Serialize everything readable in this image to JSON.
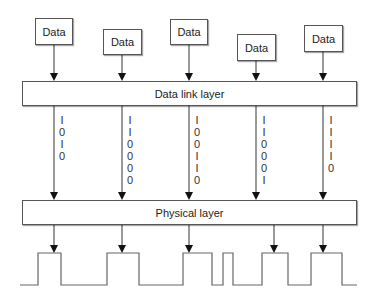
{
  "diagram": {
    "data_boxes": [
      {
        "label": "Data",
        "x": 35,
        "y": 18,
        "w": 38,
        "h": 27,
        "arrow_x": 54
      },
      {
        "label": "Data",
        "x": 103,
        "y": 29,
        "w": 39,
        "h": 26,
        "arrow_x": 122
      },
      {
        "label": "Data",
        "x": 170,
        "y": 19,
        "w": 38,
        "h": 26,
        "arrow_x": 189
      },
      {
        "label": "Data",
        "x": 237,
        "y": 34,
        "w": 39,
        "h": 27,
        "arrow_x": 256
      },
      {
        "label": "Data",
        "x": 304,
        "y": 25,
        "w": 39,
        "h": 27,
        "arrow_x": 323
      }
    ],
    "data_link_layer": {
      "label": "Data link layer",
      "x": 22,
      "y": 81,
      "w": 335,
      "h": 25
    },
    "physical_layer": {
      "label": "Physical layer",
      "x": 22,
      "y": 200,
      "w": 335,
      "h": 25
    },
    "bit_columns": [
      {
        "x": 62,
        "bits": [
          "1",
          "0",
          "1",
          "0"
        ]
      },
      {
        "x": 130,
        "bits": [
          "1",
          "1",
          "0",
          "0",
          "0",
          "0"
        ]
      },
      {
        "x": 197,
        "bits": [
          "1",
          "0",
          "0",
          "1",
          "1",
          "0"
        ]
      },
      {
        "x": 264,
        "bits": [
          "1",
          "1",
          "0",
          "0",
          "0",
          "1"
        ]
      },
      {
        "x": 331,
        "bits": [
          "1",
          "1",
          "1",
          "1",
          "0"
        ]
      }
    ],
    "bottom_arrows_x": [
      54,
      122,
      189,
      274,
      323
    ],
    "waveform": {
      "low_y": 285,
      "high_y": 253,
      "points_x": [
        20,
        38,
        61,
        107,
        139,
        183,
        212,
        223,
        233,
        262,
        288,
        311,
        342,
        357
      ],
      "start_level": "low"
    },
    "colors": {
      "line": "#555555",
      "arrowhead": "#111111",
      "text": "#222222"
    }
  }
}
